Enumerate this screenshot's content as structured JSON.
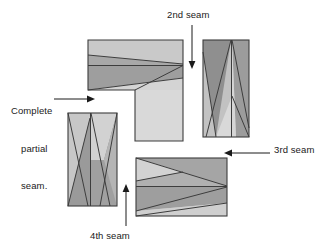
{
  "figure": {
    "background_color": "#ffffff",
    "outline_color": "#3d3d3d",
    "text_color": "#1a1a1a",
    "fabric_colors": {
      "light": "#d9d9d9",
      "medium_light": "#c4c4c4",
      "medium": "#a8a8a8",
      "medium_dark": "#9a9a9a",
      "dark": "#8f8f8f"
    }
  },
  "labels": {
    "second_seam": "2nd seam",
    "third_seam": "3rd seam",
    "fourth_seam": "4th seam",
    "complete_partial_seam_line1": "Complete",
    "complete_partial_seam_line2": "partial",
    "complete_partial_seam_line3": "seam."
  },
  "blocks": [
    {
      "name": "top-left-l-block",
      "description": "L-shaped unit: horizontal pieced bar across the top with a plain square extending downward on its right end"
    },
    {
      "name": "right-vertical-block",
      "description": "Vertical pieced rectangle split by a center vertical seam with crossing diagonals"
    },
    {
      "name": "bottom-left-vertical-block",
      "description": "Vertical pieced rectangle split by a center vertical seam with crossing diagonals, reversed shading"
    },
    {
      "name": "bottom-center-horizontal-block",
      "description": "Horizontal pieced rectangle with a center horizontal seam and crossing diagonals"
    }
  ],
  "arrows": [
    {
      "name": "second-seam-arrow",
      "direction": "down",
      "points_to": "top-left-l-block right edge"
    },
    {
      "name": "third-seam-arrow",
      "direction": "left",
      "points_to": "right-vertical-block lower edge"
    },
    {
      "name": "fourth-seam-arrow",
      "direction": "up",
      "points_to": "bottom-center-horizontal-block left edge"
    },
    {
      "name": "complete-partial-seam-arrow",
      "direction": "right",
      "points_to": "top-left-l-block lower left corner"
    }
  ]
}
